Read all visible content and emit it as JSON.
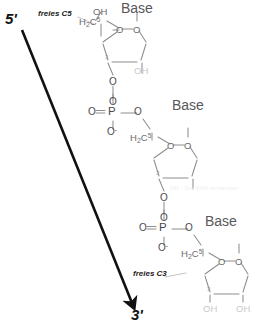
{
  "diagram": {
    "type": "chemical-structure",
    "colors": {
      "bond": "#8e8e90",
      "bond_dark": "#6b6b6d",
      "text_atom": "#6b6b6d",
      "text_base": "#58585a",
      "arrow": "#111111",
      "faint_oh": "#c9c9cb",
      "watermark": "#ededf0",
      "background": "#ffffff"
    }
  },
  "direction": {
    "five_prime": "5'",
    "three_prime": "3'"
  },
  "annotations": {
    "free_c5": "freies C5",
    "free_c3": "freies C3"
  },
  "watermark": {
    "text": "OH - Die RNA vorhanden"
  },
  "bases": [
    {
      "label": "Base"
    },
    {
      "label": "Base"
    },
    {
      "label": "Base"
    }
  ],
  "nucleotides": [
    {
      "id": "top",
      "hydroxyl_5prime": "OH",
      "carbon5": {
        "h": "H",
        "h_sub": "2",
        "c": "C",
        "prime": "5"
      },
      "ring_oxygen": "O",
      "base_oxygen": "O",
      "ring_numbers": [
        "5",
        "3",
        "2",
        "1",
        "4"
      ],
      "c2_hydroxyl": "OH",
      "c3_oxygen": "O"
    },
    {
      "id": "middle",
      "carbon5": {
        "h": "H",
        "h_sub": "2",
        "c": "C",
        "prime": "5"
      },
      "ring_oxygen": "O",
      "base_oxygen": "O",
      "ring_numbers": [
        "5",
        "3",
        "2",
        "1",
        "4"
      ],
      "c3_oxygen": "O"
    },
    {
      "id": "bottom",
      "carbon5": {
        "h": "H",
        "h_sub": "2",
        "c": "C",
        "prime": "5"
      },
      "ring_oxygen": "O",
      "base_oxygen": "O",
      "ring_numbers": [
        "5",
        "3",
        "2",
        "1",
        "4"
      ],
      "c3_hydroxyl": "OH",
      "c2_hydroxyl": "OH"
    }
  ],
  "phosphates": [
    {
      "id": "phosphate-upper",
      "p": "P",
      "double_bond_oxygen": "O",
      "top_oxygen": "O",
      "anionic_oxygen": "O",
      "anionic_charge": "-",
      "ester_oxygen": "O"
    },
    {
      "id": "phosphate-lower",
      "p": "P",
      "double_bond_oxygen": "O",
      "top_oxygen": "O",
      "anionic_oxygen": "O",
      "anionic_charge": "-",
      "ester_oxygen": "O"
    }
  ]
}
